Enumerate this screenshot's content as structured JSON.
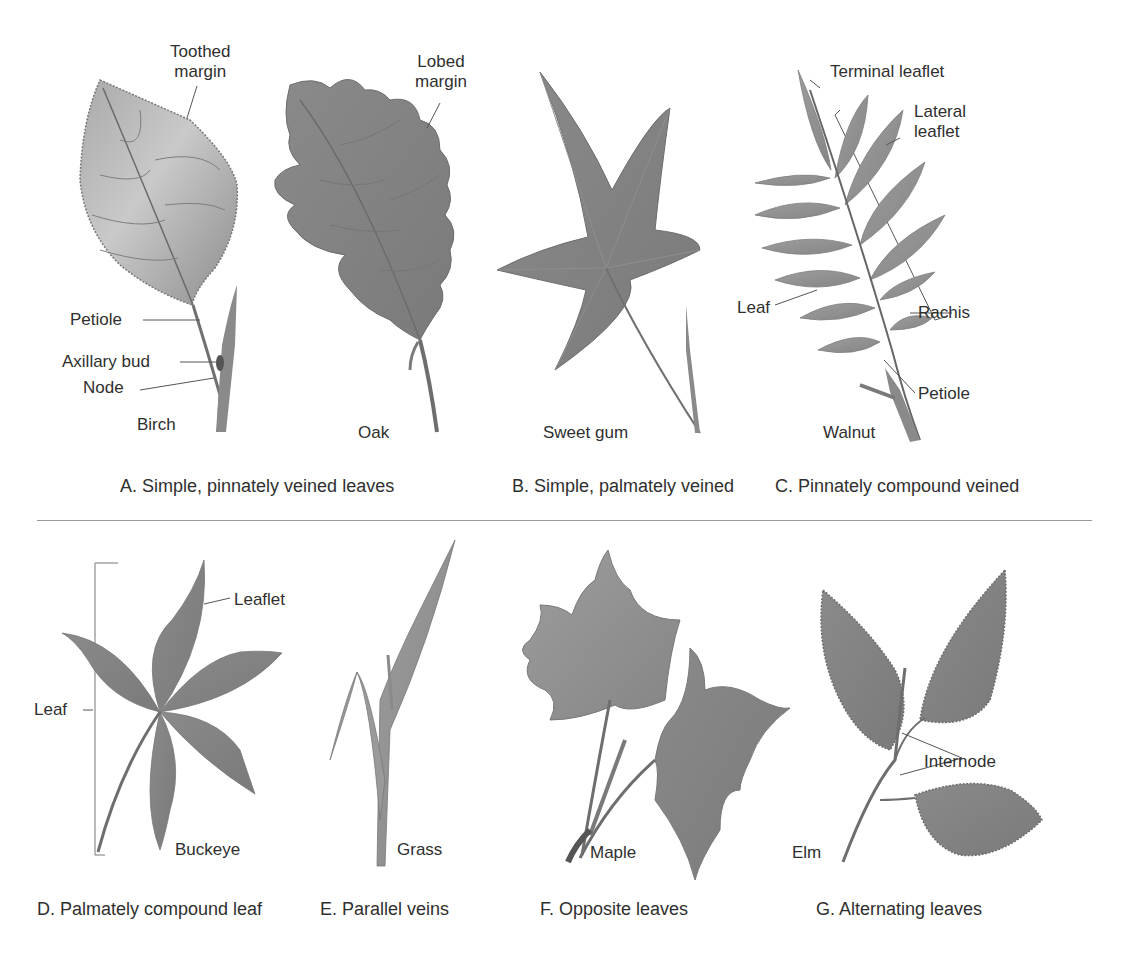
{
  "figure": {
    "panels": [
      {
        "id": "A",
        "caption": "A. Simple, pinnately veined leaves",
        "specimens": [
          {
            "name": "Birch",
            "labels": [
              "Toothed margin",
              "Petiole",
              "Axillary bud",
              "Node"
            ]
          },
          {
            "name": "Oak",
            "labels": [
              "Lobed margin"
            ]
          }
        ]
      },
      {
        "id": "B",
        "caption": "B. Simple, palmately veined",
        "specimens": [
          {
            "name": "Sweet gum",
            "labels": []
          }
        ]
      },
      {
        "id": "C",
        "caption": "C. Pinnately compound veined",
        "specimens": [
          {
            "name": "Walnut",
            "labels": [
              "Terminal leaflet",
              "Lateral leaflet",
              "Leaf",
              "Rachis",
              "Petiole"
            ]
          }
        ]
      },
      {
        "id": "D",
        "caption": "D. Palmately compound leaf",
        "specimens": [
          {
            "name": "Buckeye",
            "labels": [
              "Leaflet",
              "Leaf"
            ]
          }
        ]
      },
      {
        "id": "E",
        "caption": "E. Parallel veins",
        "specimens": [
          {
            "name": "Grass",
            "labels": []
          }
        ]
      },
      {
        "id": "F",
        "caption": "F. Opposite leaves",
        "specimens": [
          {
            "name": "Maple",
            "labels": []
          }
        ]
      },
      {
        "id": "G",
        "caption": "G. Alternating leaves",
        "specimens": [
          {
            "name": "Elm",
            "labels": [
              "Internode"
            ]
          }
        ]
      }
    ],
    "labels": {
      "toothed_margin_1": "Toothed",
      "toothed_margin_2": "margin",
      "lobed_margin_1": "Lobed",
      "lobed_margin_2": "margin",
      "petiole_birch": "Petiole",
      "axillary_bud": "Axillary bud",
      "node": "Node",
      "birch": "Birch",
      "oak": "Oak",
      "sweet_gum": "Sweet gum",
      "terminal_leaflet": "Terminal leaflet",
      "lateral_leaflet_1": "Lateral",
      "lateral_leaflet_2": "leaflet",
      "leaf_walnut": "Leaf",
      "rachis": "Rachis",
      "petiole_walnut": "Petiole",
      "walnut": "Walnut",
      "leaflet_buckeye": "Leaflet",
      "leaf_buckeye": "Leaf",
      "buckeye": "Buckeye",
      "grass": "Grass",
      "maple": "Maple",
      "internode": "Internode",
      "elm": "Elm"
    },
    "colors": {
      "leaf_fill": "#8c8c8c",
      "leaf_light": "#b5b5b5",
      "stem": "#6e6e6e",
      "text": "#2f2f2f",
      "divider": "#9a9a9a"
    }
  }
}
